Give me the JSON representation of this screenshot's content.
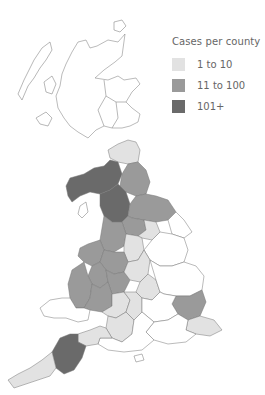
{
  "legend": {
    "title": "Cases per county",
    "items": [
      {
        "label": "1 to 10",
        "color": "#e2e2e2"
      },
      {
        "label": "11 to 100",
        "color": "#9a9a9a"
      },
      {
        "label": "101+",
        "color": "#6a6a6a"
      }
    ]
  },
  "colors": {
    "none": "#ffffff",
    "low": "#e2e2e2",
    "mid": "#9a9a9a",
    "high": "#6a6a6a",
    "border": "#777777"
  },
  "map": {
    "region": "Great Britain",
    "regions": [
      {
        "name": "scotland",
        "category": "none"
      },
      {
        "name": "cumbria",
        "category": "high"
      },
      {
        "name": "northumberland",
        "category": "low"
      },
      {
        "name": "durham",
        "category": "mid"
      },
      {
        "name": "north-yorkshire",
        "category": "mid"
      },
      {
        "name": "lancashire",
        "category": "high"
      },
      {
        "name": "west-yorkshire",
        "category": "mid"
      },
      {
        "name": "east-yorkshire",
        "category": "none"
      },
      {
        "name": "merseyside-cheshire",
        "category": "mid"
      },
      {
        "name": "south-yorkshire",
        "category": "low"
      },
      {
        "name": "derbyshire",
        "category": "low"
      },
      {
        "name": "lincolnshire",
        "category": "none"
      },
      {
        "name": "north-wales",
        "category": "mid"
      },
      {
        "name": "shropshire",
        "category": "mid"
      },
      {
        "name": "staffordshire",
        "category": "mid"
      },
      {
        "name": "west-midlands",
        "category": "mid"
      },
      {
        "name": "mid-wales",
        "category": "mid"
      },
      {
        "name": "worcestershire",
        "category": "mid"
      },
      {
        "name": "leicestershire",
        "category": "low"
      },
      {
        "name": "south-wales",
        "category": "none"
      },
      {
        "name": "gloucestershire",
        "category": "low"
      },
      {
        "name": "oxfordshire",
        "category": "low"
      },
      {
        "name": "northamptonshire",
        "category": "low"
      },
      {
        "name": "east-anglia",
        "category": "none"
      },
      {
        "name": "essex",
        "category": "mid"
      },
      {
        "name": "kent",
        "category": "low"
      },
      {
        "name": "somerset",
        "category": "low"
      },
      {
        "name": "wiltshire",
        "category": "low"
      },
      {
        "name": "devon",
        "category": "high"
      },
      {
        "name": "cornwall",
        "category": "low"
      },
      {
        "name": "dorset-hampshire",
        "category": "none"
      },
      {
        "name": "sussex-surrey",
        "category": "none"
      }
    ]
  }
}
